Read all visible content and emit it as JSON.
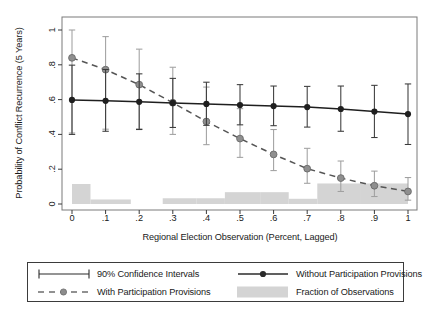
{
  "chart_data": {
    "type": "line",
    "title": "",
    "xlabel": "Regional Election Observation (Percent, Lagged)",
    "ylabel": "Probability of Conflict Recurrence (5 Years)",
    "xlim": [
      0,
      1
    ],
    "ylim": [
      0,
      1
    ],
    "xticks": [
      0,
      0.1,
      0.2,
      0.3,
      0.4,
      0.5,
      0.6,
      0.7,
      0.8,
      0.9,
      1
    ],
    "xticklabels": [
      "0",
      ".1",
      ".2",
      ".3",
      ".4",
      ".5",
      ".6",
      ".7",
      ".8",
      ".9",
      "1"
    ],
    "yticks": [
      0,
      0.2,
      0.4,
      0.6,
      0.8,
      1
    ],
    "yticklabels": [
      "0",
      ".2",
      ".4",
      ".6",
      ".8",
      "1"
    ],
    "grid": false,
    "legend_position": "below-plot",
    "x": [
      0,
      0.1,
      0.2,
      0.3,
      0.4,
      0.5,
      0.6,
      0.7,
      0.8,
      0.9,
      1
    ],
    "series": [
      {
        "name": "Without Participation Provisions",
        "style": "solid-line-with-markers",
        "color": "#2b2b2b",
        "values": [
          0.598,
          0.593,
          0.587,
          0.581,
          0.575,
          0.569,
          0.563,
          0.557,
          0.546,
          0.531,
          0.517
        ],
        "ci_lower": [
          0.4,
          0.418,
          0.428,
          0.44,
          0.452,
          0.455,
          0.45,
          0.442,
          0.418,
          0.382,
          0.342
        ],
        "ci_upper": [
          0.798,
          0.773,
          0.748,
          0.722,
          0.7,
          0.686,
          0.678,
          0.676,
          0.678,
          0.682,
          0.69
        ]
      },
      {
        "name": "With Participation Provisions",
        "style": "dashed-line-with-markers",
        "color": "#8c8c8c",
        "values": [
          0.84,
          0.772,
          0.686,
          0.582,
          0.474,
          0.376,
          0.285,
          0.203,
          0.149,
          0.105,
          0.072
        ],
        "ci_lower": [
          0.408,
          0.43,
          0.432,
          0.4,
          0.341,
          0.268,
          0.192,
          0.119,
          0.072,
          0.043,
          0.022
        ],
        "ci_upper": [
          1.0,
          0.962,
          0.89,
          0.786,
          0.672,
          0.548,
          0.428,
          0.32,
          0.247,
          0.189,
          0.152
        ]
      }
    ],
    "histogram": {
      "name": "Fraction of Observations",
      "color": "#d4d4d4",
      "bin_edges": [
        0.0,
        0.055,
        0.175,
        0.27,
        0.37,
        0.455,
        0.56,
        0.645,
        0.73,
        0.86,
        1.0
      ],
      "values": [
        0.115,
        0.026,
        0.0,
        0.033,
        0.033,
        0.068,
        0.068,
        0.03,
        0.118,
        0.118,
        0.098
      ]
    }
  },
  "legend": {
    "entries": [
      {
        "key": "errorbar",
        "label": "90% Confidence Intervals"
      },
      {
        "key": "solid-marker-line",
        "label": "Without Participation Provisions"
      },
      {
        "key": "dashed-marker-line",
        "label": "With Participation Provisions"
      },
      {
        "key": "gray-swatch",
        "label": "Fraction of Observations"
      }
    ]
  },
  "colors": {
    "series_dark": "#2b2b2b",
    "series_light": "#8c8c8c",
    "histogram": "#d4d4d4",
    "frame": "#7a7a7a",
    "text": "#1a1a1a"
  }
}
